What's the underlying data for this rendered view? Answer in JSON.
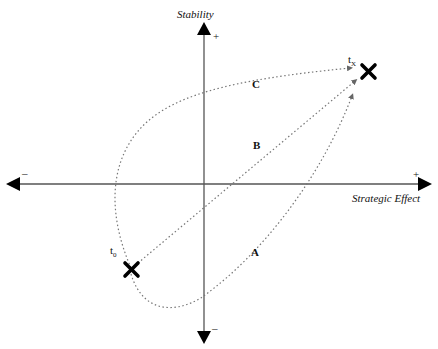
{
  "axes": {
    "y": {
      "title": "Stability",
      "positive": "+",
      "negative": "–"
    },
    "x": {
      "title": "Strategic Effect",
      "positive": "+",
      "negative": "–"
    }
  },
  "points": {
    "start": {
      "label": "t",
      "subscript": "0",
      "marker": "x-mark"
    },
    "end": {
      "label": "t",
      "subscript": "X",
      "marker": "x-mark"
    }
  },
  "paths": [
    {
      "id": "A",
      "label": "A",
      "style": "dotted",
      "description": "curves down below then rises to end"
    },
    {
      "id": "B",
      "label": "B",
      "style": "dotted",
      "description": "direct diagonal path"
    },
    {
      "id": "C",
      "label": "C",
      "style": "dotted",
      "description": "loops up left then across top to end"
    }
  ],
  "colors": {
    "axis": "#000000",
    "path": "#777777",
    "marker": "#000000"
  }
}
